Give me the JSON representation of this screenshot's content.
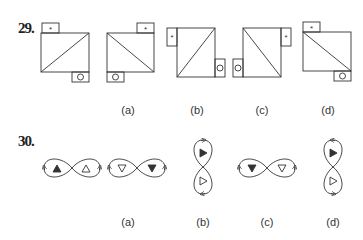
{
  "questions": [
    {
      "number": "29.",
      "question_figure": "rectangle-with-diagonal-star-tab-circle-tab",
      "options": [
        {
          "label": "(a)"
        },
        {
          "label": "(b)"
        },
        {
          "label": "(c)"
        },
        {
          "label": "(d)"
        }
      ],
      "symbols": {
        "star": "*"
      }
    },
    {
      "number": "30.",
      "question_figure": "figure-eight-with-triangles",
      "options": [
        {
          "label": "(a)"
        },
        {
          "label": "(b)"
        },
        {
          "label": "(c)"
        },
        {
          "label": "(d)"
        }
      ]
    }
  ],
  "colors": {
    "stroke": "#333333",
    "fill_dark": "#333333"
  }
}
